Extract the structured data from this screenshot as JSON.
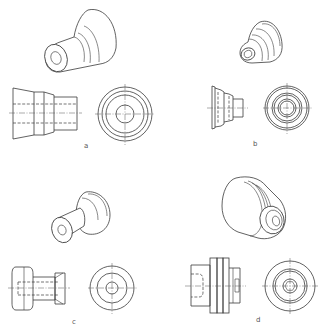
{
  "figure": {
    "panels": [
      {
        "id": "a",
        "label": "a",
        "pictorial": "stepped cylinder with flared conical base and through hole",
        "views": [
          "front-view",
          "end-view"
        ]
      },
      {
        "id": "b",
        "label": "b",
        "pictorial": "multi-stepped conical part with flange and small bore",
        "views": [
          "front-view",
          "end-view"
        ]
      },
      {
        "id": "c",
        "label": "c",
        "pictorial": "spool/knob with large collar, narrow neck and countersunk bore",
        "views": [
          "front-view",
          "end-view"
        ]
      },
      {
        "id": "d",
        "label": "d",
        "pictorial": "grooved cylinder with three ribs and hexagon socket",
        "views": [
          "front-view",
          "end-view"
        ]
      }
    ]
  },
  "colors": {
    "line": "#3a3a3a",
    "background": "#ffffff"
  }
}
